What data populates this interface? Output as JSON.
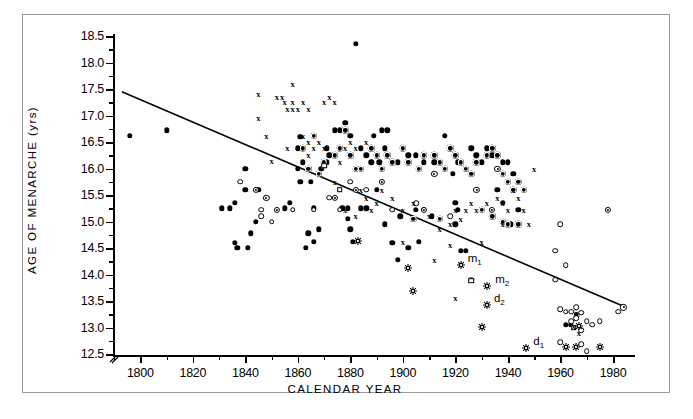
{
  "figure": {
    "background": "#ffffff",
    "frame_color": "#9a9a9a",
    "ink_color": "#000000"
  },
  "axes": {
    "y_title": "AGE OF MENARCHE (yrs)",
    "x_title": "CALENDAR YEAR",
    "y_ticks": [
      "18.5",
      "18.0",
      "17.5",
      "17.0",
      "16.5",
      "16.0",
      "15.5",
      "15.0",
      "14.5",
      "14.0",
      "13.5",
      "13.0",
      "12.5"
    ],
    "x_ticks": [
      "1800",
      "1820",
      "1840",
      "1860",
      "1880",
      "1900",
      "1920",
      "1940",
      "1960",
      "1980"
    ],
    "axis_break": true
  },
  "annotations": [
    {
      "id": "m1",
      "label": "m",
      "sub": "1",
      "x": 1922.0,
      "y": 14.28
    },
    {
      "id": "m2",
      "label": "m",
      "sub": "2",
      "x": 1932.5,
      "y": 13.87
    },
    {
      "id": "d2",
      "label": "d",
      "sub": "2",
      "x": 1932.0,
      "y": 13.52
    },
    {
      "id": "d1",
      "label": "d",
      "sub": "1",
      "x": 1947.0,
      "y": 12.7
    }
  ],
  "chart_data": {
    "type": "scatter",
    "title": "",
    "xlabel": "CALENDAR YEAR",
    "ylabel": "AGE OF MENARCHE (yrs)",
    "xlim": [
      1790,
      1988
    ],
    "ylim": [
      12.5,
      18.5
    ],
    "grid": false,
    "legend_position": "none",
    "trendline": {
      "type": "linear",
      "x_start": 1793.0,
      "y_start": 17.45,
      "x_end": 1984.0,
      "y_end": 13.4
    },
    "series": [
      {
        "name": "filled-circle",
        "marker": "filled",
        "points": [
          [
            1796,
            16.62
          ],
          [
            1810,
            16.72
          ],
          [
            1836,
            15.35
          ],
          [
            1831,
            15.25
          ],
          [
            1834,
            15.25
          ],
          [
            1836,
            14.6
          ],
          [
            1837,
            14.5
          ],
          [
            1841,
            14.5
          ],
          [
            1840,
            16.0
          ],
          [
            1842,
            14.78
          ],
          [
            1844,
            15.0
          ],
          [
            1845,
            15.6
          ],
          [
            1840,
            15.6
          ],
          [
            1857,
            15.35
          ],
          [
            1855,
            15.25
          ],
          [
            1863,
            14.5
          ],
          [
            1866,
            14.62
          ],
          [
            1864,
            14.78
          ],
          [
            1868,
            14.85
          ],
          [
            1866,
            15.25
          ],
          [
            1861,
            16.6
          ],
          [
            1860,
            16.38
          ],
          [
            1862,
            16.12
          ],
          [
            1861,
            15.75
          ],
          [
            1865,
            15.75
          ],
          [
            1860,
            16.0
          ],
          [
            1869,
            16.0
          ],
          [
            1871,
            16.38
          ],
          [
            1874,
            16.72
          ],
          [
            1876,
            16.72
          ],
          [
            1878,
            16.86
          ],
          [
            1872,
            16.25
          ],
          [
            1871,
            16.12
          ],
          [
            1880,
            16.62
          ],
          [
            1882,
            18.35
          ],
          [
            1877,
            15.25
          ],
          [
            1879,
            15.25
          ],
          [
            1879,
            15.05
          ],
          [
            1880,
            14.85
          ],
          [
            1881,
            14.62
          ],
          [
            1884,
            15.25
          ],
          [
            1886,
            15.25
          ],
          [
            1888,
            16.12
          ],
          [
            1886,
            16.25
          ],
          [
            1884,
            16.38
          ],
          [
            1889,
            16.62
          ],
          [
            1892,
            16.72
          ],
          [
            1894,
            16.72
          ],
          [
            1893,
            16.38
          ],
          [
            1891,
            16.12
          ],
          [
            1890,
            15.6
          ],
          [
            1893,
            14.95
          ],
          [
            1896,
            14.6
          ],
          [
            1898,
            14.28
          ],
          [
            1902,
            14.5
          ],
          [
            1899,
            15.1
          ],
          [
            1905,
            15.22
          ],
          [
            1908,
            15.22
          ],
          [
            1911,
            15.1
          ],
          [
            1906,
            14.62
          ],
          [
            1898,
            16.12
          ],
          [
            1902,
            16.25
          ],
          [
            1905,
            16.25
          ],
          [
            1908,
            16.12
          ],
          [
            1912,
            16.12
          ],
          [
            1916,
            16.62
          ],
          [
            1918,
            16.38
          ],
          [
            1920,
            16.25
          ],
          [
            1921,
            16.12
          ],
          [
            1919,
            15.9
          ],
          [
            1920,
            15.35
          ],
          [
            1921,
            15.22
          ],
          [
            1920,
            14.95
          ],
          [
            1922,
            14.45
          ],
          [
            1924,
            14.45
          ],
          [
            1926,
            16.38
          ],
          [
            1928,
            16.25
          ],
          [
            1930,
            16.12
          ],
          [
            1932,
            16.38
          ],
          [
            1934,
            16.25
          ],
          [
            1938,
            16.12
          ],
          [
            1940,
            16.12
          ],
          [
            1942,
            15.9
          ],
          [
            1936,
            15.6
          ],
          [
            1938,
            15.35
          ],
          [
            1944,
            15.22
          ],
          [
            1941,
            14.95
          ],
          [
            1962,
            13.05
          ],
          [
            1964,
            13.05
          ]
        ]
      },
      {
        "name": "bullseye-circle",
        "marker": "bullseye",
        "points": [
          [
            1862,
            16.38
          ],
          [
            1866,
            16.62
          ],
          [
            1864,
            16.0
          ],
          [
            1870,
            16.12
          ],
          [
            1868,
            15.9
          ],
          [
            1874,
            16.25
          ],
          [
            1878,
            16.72
          ],
          [
            1876,
            16.38
          ],
          [
            1880,
            16.25
          ],
          [
            1882,
            16.0
          ],
          [
            1884,
            16.0
          ],
          [
            1888,
            16.38
          ],
          [
            1890,
            16.25
          ],
          [
            1892,
            16.0
          ],
          [
            1894,
            16.25
          ],
          [
            1896,
            16.12
          ],
          [
            1900,
            16.38
          ],
          [
            1902,
            16.12
          ],
          [
            1906,
            16.0
          ],
          [
            1908,
            16.25
          ],
          [
            1912,
            16.25
          ],
          [
            1914,
            16.12
          ],
          [
            1916,
            16.0
          ],
          [
            1918,
            16.38
          ],
          [
            1920,
            16.25
          ],
          [
            1922,
            16.12
          ],
          [
            1924,
            16.0
          ],
          [
            1926,
            15.9
          ],
          [
            1928,
            16.12
          ],
          [
            1932,
            16.25
          ],
          [
            1936,
            16.25
          ],
          [
            1934,
            16.38
          ],
          [
            1938,
            15.9
          ],
          [
            1940,
            15.75
          ],
          [
            1942,
            15.6
          ],
          [
            1944,
            15.75
          ],
          [
            1946,
            15.6
          ],
          [
            1930,
            15.22
          ],
          [
            1934,
            15.1
          ],
          [
            1938,
            15.0
          ],
          [
            1940,
            14.95
          ],
          [
            1944,
            14.95
          ],
          [
            1904,
            15.05
          ],
          [
            1914,
            15.05
          ],
          [
            1966,
            13.25
          ]
        ]
      },
      {
        "name": "open-circle",
        "marker": "open",
        "points": [
          [
            1838,
            15.75
          ],
          [
            1846,
            15.22
          ],
          [
            1846,
            15.1
          ],
          [
            1850,
            15.0
          ],
          [
            1858,
            15.22
          ],
          [
            1866,
            15.22
          ],
          [
            1872,
            15.45
          ],
          [
            1876,
            15.22
          ],
          [
            1886,
            15.6
          ],
          [
            1880,
            15.75
          ],
          [
            1896,
            15.22
          ],
          [
            1905,
            15.35
          ],
          [
            1918,
            15.1
          ],
          [
            1926,
            13.9
          ],
          [
            1958,
            14.45
          ],
          [
            1960,
            14.95
          ],
          [
            1962,
            14.18
          ],
          [
            1958,
            13.9
          ],
          [
            1966,
            13.38
          ],
          [
            1960,
            13.35
          ],
          [
            1962,
            13.3
          ],
          [
            1964,
            13.3
          ],
          [
            1968,
            13.28
          ],
          [
            1966,
            13.18
          ],
          [
            1970,
            13.12
          ],
          [
            1972,
            13.05
          ],
          [
            1960,
            12.72
          ],
          [
            1968,
            12.68
          ],
          [
            1970,
            12.55
          ],
          [
            1982,
            13.3
          ],
          [
            1975,
            13.12
          ],
          [
            1968,
            12.95
          ],
          [
            1964,
            13.12
          ]
        ]
      },
      {
        "name": "open-dot-circle",
        "marker": "opendot",
        "points": [
          [
            1844,
            15.6
          ],
          [
            1852,
            15.22
          ],
          [
            1848,
            15.45
          ],
          [
            1874,
            15.45
          ],
          [
            1882,
            15.6
          ],
          [
            1892,
            15.75
          ],
          [
            1908,
            15.22
          ],
          [
            1912,
            15.9
          ],
          [
            1928,
            15.6
          ],
          [
            1934,
            15.22
          ],
          [
            1936,
            16.0
          ],
          [
            1978,
            15.22
          ],
          [
            1984,
            13.38
          ]
        ]
      },
      {
        "name": "open-square",
        "marker": "square",
        "points": [
          [
            1870,
            16.05
          ],
          [
            1876,
            15.6
          ],
          [
            1926,
            13.88
          ],
          [
            1965,
            13.0
          ]
        ]
      },
      {
        "name": "cross",
        "marker": "cross",
        "points": [
          [
            1845,
            17.4
          ],
          [
            1845,
            16.95
          ],
          [
            1852,
            17.35
          ],
          [
            1854,
            17.35
          ],
          [
            1855,
            17.25
          ],
          [
            1858,
            17.6
          ],
          [
            1858,
            17.25
          ],
          [
            1862,
            17.25
          ],
          [
            1856,
            17.12
          ],
          [
            1858,
            17.12
          ],
          [
            1860,
            17.12
          ],
          [
            1864,
            17.12
          ],
          [
            1870,
            17.25
          ],
          [
            1872,
            17.35
          ],
          [
            1874,
            17.25
          ],
          [
            1848,
            16.62
          ],
          [
            1850,
            16.15
          ],
          [
            1856,
            16.38
          ],
          [
            1862,
            16.62
          ],
          [
            1864,
            16.5
          ],
          [
            1866,
            16.38
          ],
          [
            1864,
            16.25
          ],
          [
            1868,
            16.5
          ],
          [
            1870,
            16.38
          ],
          [
            1874,
            15.75
          ],
          [
            1878,
            16.38
          ],
          [
            1880,
            16.5
          ],
          [
            1882,
            16.38
          ],
          [
            1886,
            16.5
          ],
          [
            1876,
            16.12
          ],
          [
            1884,
            15.6
          ],
          [
            1886,
            15.45
          ],
          [
            1890,
            15.35
          ],
          [
            1888,
            15.22
          ],
          [
            1892,
            15.6
          ],
          [
            1878,
            15.22
          ],
          [
            1882,
            15.1
          ],
          [
            1896,
            15.45
          ],
          [
            1900,
            15.22
          ],
          [
            1904,
            15.35
          ],
          [
            1910,
            15.1
          ],
          [
            1914,
            14.85
          ],
          [
            1918,
            14.95
          ],
          [
            1920,
            15.22
          ],
          [
            1922,
            15.05
          ],
          [
            1924,
            15.22
          ],
          [
            1926,
            15.35
          ],
          [
            1928,
            15.22
          ],
          [
            1932,
            15.35
          ],
          [
            1936,
            15.45
          ],
          [
            1938,
            15.35
          ],
          [
            1940,
            15.22
          ],
          [
            1942,
            15.6
          ],
          [
            1944,
            15.45
          ],
          [
            1946,
            15.22
          ],
          [
            1938,
            14.95
          ],
          [
            1930,
            14.62
          ],
          [
            1918,
            14.55
          ],
          [
            1912,
            14.28
          ],
          [
            1920,
            13.55
          ],
          [
            1948,
            14.95
          ],
          [
            1900,
            14.62
          ],
          [
            1965,
            13.02
          ],
          [
            1967,
            12.9
          ],
          [
            1950,
            16.0
          ]
        ]
      },
      {
        "name": "star",
        "marker": "star",
        "points": [
          [
            1883,
            14.72
          ],
          [
            1902,
            14.22
          ],
          [
            1904,
            13.78
          ],
          [
            1922,
            14.28
          ],
          [
            1932,
            13.87
          ],
          [
            1932,
            13.52
          ],
          [
            1930,
            13.1
          ],
          [
            1947,
            12.7
          ],
          [
            1962,
            12.72
          ],
          [
            1975,
            12.72
          ],
          [
            1967,
            13.12
          ],
          [
            1966,
            12.72
          ]
        ]
      }
    ]
  }
}
